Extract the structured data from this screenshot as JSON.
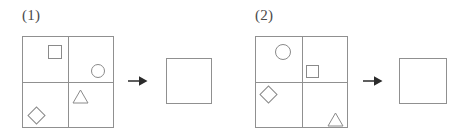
{
  "page": {
    "background_color": "#ffffff",
    "line_color": "#909090",
    "shape_color": "#8a8a8a",
    "text_color": "#4a4a4a",
    "width": 475,
    "height": 137
  },
  "items": [
    {
      "label": "(1)",
      "grid": {
        "name": "four-quadrant-grid",
        "columns": 2,
        "rows": 2,
        "quadrants": [
          {
            "position": "top-left",
            "shape": "square"
          },
          {
            "position": "top-right",
            "shape": "circle"
          },
          {
            "position": "bottom-left",
            "shape": "diamond"
          },
          {
            "position": "bottom-right",
            "shape": "triangle"
          }
        ]
      },
      "arrow": "right-arrow",
      "answer_box": {
        "name": "answer-box",
        "content": ""
      }
    },
    {
      "label": "(2)",
      "grid": {
        "name": "four-quadrant-grid",
        "columns": 2,
        "rows": 2,
        "quadrants": [
          {
            "position": "top-left",
            "shape": "circle"
          },
          {
            "position": "top-right",
            "shape": "square"
          },
          {
            "position": "bottom-left",
            "shape": "diamond"
          },
          {
            "position": "bottom-right",
            "shape": "triangle"
          }
        ]
      },
      "arrow": "right-arrow",
      "answer_box": {
        "name": "answer-box",
        "content": ""
      }
    }
  ]
}
